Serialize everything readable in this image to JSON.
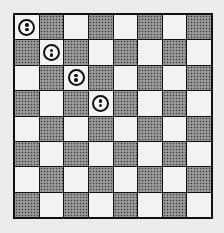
{
  "board": {
    "rows": 8,
    "cols": 8,
    "top_left_color": "light",
    "colors": {
      "light": "#f2f2f2",
      "dark": "#8a8a8a",
      "border": "#111111",
      "background": "#ececec"
    },
    "pieces": [
      {
        "row": 0,
        "col": 0,
        "type": "two-dot-circle"
      },
      {
        "row": 1,
        "col": 1,
        "type": "two-dot-circle"
      },
      {
        "row": 2,
        "col": 2,
        "type": "two-dot-circle"
      },
      {
        "row": 3,
        "col": 3,
        "type": "two-dot-circle"
      }
    ]
  }
}
